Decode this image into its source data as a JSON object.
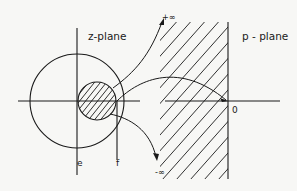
{
  "diagram": {
    "labels": {
      "z_plane": "z-plane",
      "p_plane": "p - plane",
      "plus_infinity": "+∞",
      "minus_infinity": "-∞",
      "origin": "0",
      "point_e": "e",
      "point_f": "f"
    },
    "colors": {
      "ink": "#1a1a1a",
      "background": "#f7f7f5"
    }
  }
}
